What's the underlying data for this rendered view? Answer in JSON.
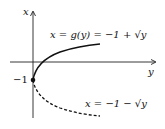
{
  "axes": {
    "vertical_label": "x",
    "horizontal_label": "y"
  },
  "point_label": "−1",
  "upper_curve": {
    "label": "x = g(y) = −1 + √y",
    "style": "solid"
  },
  "lower_curve": {
    "label": "x = −1 − √y",
    "style": "dashed"
  }
}
